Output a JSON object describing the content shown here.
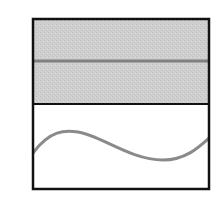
{
  "diagram": {
    "frame": {
      "x": 33,
      "y": 19,
      "width": 176,
      "height": 170,
      "stroke": "#111111"
    },
    "top_panel": {
      "fill": "#cdcdcd",
      "divider_y": 104,
      "line_y": 61,
      "line_color": "#808080"
    },
    "bottom_panel": {
      "fill": "#ffffff",
      "wave_color": "#8a8a8a"
    }
  }
}
